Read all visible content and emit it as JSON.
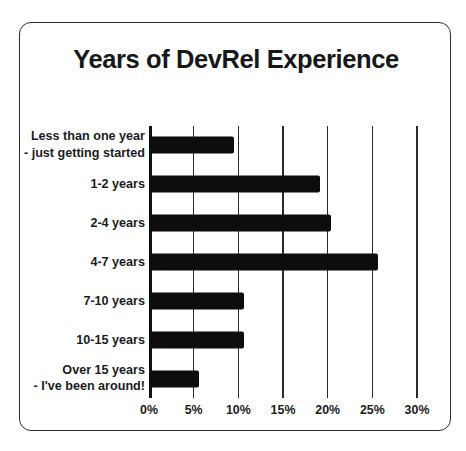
{
  "card": {
    "border_color": "#2b2b2b",
    "background": "#ffffff"
  },
  "chart_data": {
    "type": "bar",
    "orientation": "horizontal",
    "title": "Years of DevRel Experience",
    "xlabel": "",
    "ylabel": "",
    "xlim": [
      0,
      30
    ],
    "grid": true,
    "legend": false,
    "bar_color": "#0d0d0d",
    "categories": [
      "Less than one year\n- just getting started",
      "1-2 years",
      "2-4 years",
      "4-7 years",
      "7-10 years",
      "10-15 years",
      "Over 15 years\n- I've been around!"
    ],
    "values": [
      9.5,
      19.1,
      20.4,
      25.6,
      10.6,
      10.6,
      5.6
    ],
    "tick_values": [
      0,
      5,
      10,
      15,
      20,
      25,
      30
    ],
    "tick_labels": [
      "0%",
      "5%",
      "10%",
      "15%",
      "20%",
      "25%",
      "30%"
    ]
  }
}
